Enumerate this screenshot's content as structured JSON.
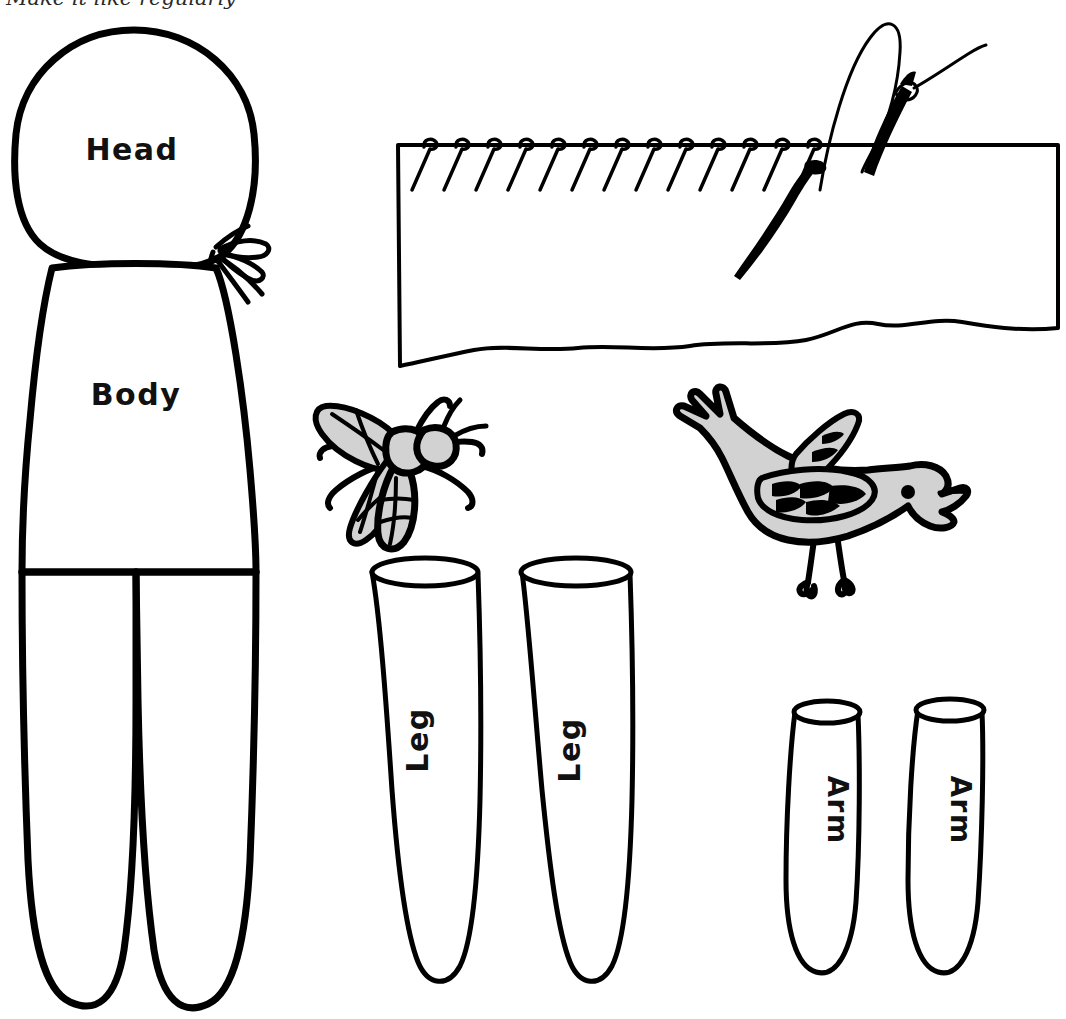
{
  "page": {
    "width": 1066,
    "height": 1019,
    "background_color": "#ffffff",
    "ink_color": "#000000",
    "gray_fill_color": "#d2d2d2"
  },
  "masthead": {
    "text_fragment": "Make it like regularly",
    "note": "clipped serif italic caption partially cut off at top edge"
  },
  "pattern_pieces": [
    {
      "id": "head",
      "label": "Head",
      "rotation_deg": 0,
      "shape": "rounded-oval-head"
    },
    {
      "id": "body",
      "label": "Body",
      "rotation_deg": 0,
      "shape": "torso-with-two-legs"
    },
    {
      "id": "leg-left",
      "label": "Leg",
      "rotation_deg": -90,
      "shape": "open-top-tube-tall"
    },
    {
      "id": "leg-right",
      "label": "Leg",
      "rotation_deg": -90,
      "shape": "open-top-tube-tall"
    },
    {
      "id": "arm-left",
      "label": "Arm",
      "rotation_deg": 90,
      "shape": "open-top-tube-short"
    },
    {
      "id": "arm-right",
      "label": "Arm",
      "rotation_deg": 90,
      "shape": "open-top-tube-short"
    }
  ],
  "illustrations": {
    "stitch_diagram": {
      "name": "whip-stitch-on-fabric",
      "stitch_count": 13,
      "has_needle": true,
      "has_thread_loop": true,
      "has_pin": true,
      "bottom_edge": "wavy-torn-edge",
      "fill": "#ffffff"
    },
    "fly": {
      "name": "fly-illustration",
      "fill": "#d2d2d2",
      "outline": "#000000",
      "wings": 2,
      "legs": 6
    },
    "bird": {
      "name": "bird-illustration",
      "fill": "#d2d2d2",
      "outline": "#000000",
      "facing": "right",
      "beak": "open",
      "legs": 2
    }
  }
}
